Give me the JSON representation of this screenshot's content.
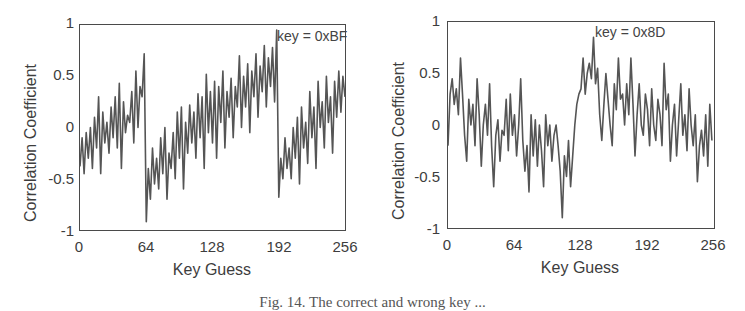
{
  "chart_data": [
    {
      "type": "line",
      "title": "",
      "xlabel": "Key Guess",
      "ylabel": "Correlation Coefficient",
      "xlim": [
        0,
        256
      ],
      "ylim": [
        -1,
        1
      ],
      "xticks": [
        "0",
        "64",
        "128",
        "192",
        "256"
      ],
      "yticks": [
        "1",
        "0.5",
        "0",
        "-0.5",
        "-1"
      ],
      "grid": false,
      "annotation": "key = 0xBF",
      "annotation_x": 191,
      "color": "#555555",
      "x_step": 2,
      "series": [
        {
          "name": "correlation",
          "values": [
            -0.38,
            -0.1,
            -0.45,
            -0.05,
            -0.3,
            0.0,
            -0.4,
            0.1,
            -0.2,
            0.3,
            -0.45,
            0.15,
            -0.15,
            0.05,
            -0.25,
            0.2,
            -0.1,
            0.3,
            -0.2,
            0.43,
            -0.4,
            0.25,
            -0.05,
            0.12,
            0.05,
            0.35,
            -0.15,
            0.55,
            0.0,
            0.4,
            0.3,
            0.72,
            -0.92,
            -0.4,
            -0.7,
            -0.2,
            -0.55,
            -0.3,
            -0.6,
            -0.1,
            -0.45,
            0.0,
            -0.7,
            -0.25,
            -0.4,
            -0.05,
            -0.5,
            0.15,
            -0.3,
            0.2,
            -0.6,
            0.05,
            -0.25,
            0.22,
            -0.15,
            0.15,
            -0.3,
            0.33,
            -0.1,
            0.3,
            -0.4,
            0.52,
            -0.05,
            0.35,
            -0.15,
            0.45,
            -0.3,
            0.4,
            0.05,
            0.55,
            -0.2,
            0.35,
            0.1,
            0.48,
            -0.1,
            0.4,
            0.2,
            0.7,
            0.0,
            0.5,
            0.2,
            0.62,
            -0.05,
            0.55,
            0.3,
            0.72,
            0.1,
            0.6,
            0.35,
            0.8,
            0.2,
            0.68,
            0.4,
            0.78,
            0.25,
            0.95,
            -0.68,
            -0.3,
            -0.5,
            -0.1,
            -0.4,
            -0.2,
            -0.5,
            0.0,
            -0.3,
            0.1,
            -0.55,
            0.2,
            -0.2,
            0.05,
            -0.35,
            0.35,
            -0.1,
            0.2,
            -0.4,
            0.45,
            0.0,
            0.25,
            -0.2,
            0.5,
            0.05,
            0.3,
            -0.25,
            0.45,
            0.1,
            0.55,
            0.15,
            0.5,
            0.3
          ]
        }
      ]
    },
    {
      "type": "line",
      "title": "",
      "xlabel": "Key Guess",
      "ylabel": "Correlation Coefficient",
      "xlim": [
        0,
        256
      ],
      "ylim": [
        -1,
        1
      ],
      "xticks": [
        "0",
        "64",
        "128",
        "192",
        "256"
      ],
      "yticks": [
        "1",
        "0.5",
        "0",
        "-0.5",
        "-1"
      ],
      "grid": false,
      "annotation": "key = 0x8D",
      "annotation_x": 141,
      "color": "#555555",
      "x_step": 2,
      "series": [
        {
          "name": "correlation",
          "values": [
            -0.2,
            0.3,
            0.45,
            0.2,
            0.35,
            0.1,
            0.65,
            0.3,
            -0.1,
            -0.35,
            0.25,
            0.0,
            0.2,
            -0.2,
            0.45,
            0.1,
            -0.4,
            0.0,
            0.2,
            -0.1,
            0.4,
            -0.2,
            -0.6,
            -0.1,
            0.05,
            -0.35,
            -0.05,
            -0.1,
            0.25,
            -0.25,
            0.3,
            -0.1,
            0.1,
            -0.3,
            0.0,
            0.45,
            -0.15,
            -0.45,
            -0.2,
            -0.65,
            0.1,
            -0.3,
            0.05,
            -0.4,
            0.0,
            -0.25,
            -0.6,
            0.1,
            -0.2,
            0.0,
            -0.35,
            -0.1,
            0.0,
            -0.2,
            -0.45,
            -0.9,
            -0.3,
            -0.5,
            -0.15,
            -0.6,
            -0.3,
            0.0,
            0.2,
            0.3,
            0.35,
            0.65,
            0.3,
            0.5,
            0.6,
            0.45,
            0.85,
            0.4,
            0.55,
            0.1,
            -0.15,
            0.2,
            0.5,
            0.25,
            0.0,
            -0.2,
            0.4,
            0.15,
            0.65,
            0.25,
            0.3,
            0.0,
            0.4,
            0.1,
            0.65,
            0.2,
            -0.3,
            0.1,
            0.4,
            0.0,
            -0.1,
            0.3,
            0.15,
            -0.2,
            0.35,
            0.0,
            -0.15,
            0.25,
            0.1,
            -0.2,
            0.6,
            0.15,
            0.3,
            -0.35,
            0.0,
            0.2,
            -0.3,
            0.05,
            0.4,
            -0.1,
            0.1,
            -0.25,
            0.35,
            0.0,
            -0.2,
            0.1,
            -0.55,
            -0.2,
            -0.05,
            -0.3,
            0.1,
            -0.4,
            0.2,
            -0.15
          ]
        }
      ]
    }
  ],
  "plots": {
    "left": {
      "ylabel": "Correlation Coefficient",
      "xlabel": "Key Guess",
      "annotation": "key = 0xBF",
      "yticks": [
        "1",
        "0.5",
        "0",
        "-0.5",
        "-1"
      ],
      "xticks": [
        "0",
        "64",
        "128",
        "192",
        "256"
      ]
    },
    "right": {
      "ylabel": "Correlation Coefficient",
      "xlabel": "Key Guess",
      "annotation": "key = 0x8D",
      "yticks": [
        "1",
        "0.5",
        "0",
        "-0.5",
        "-1"
      ],
      "xticks": [
        "0",
        "64",
        "128",
        "192",
        "256"
      ]
    }
  },
  "caption": "Fig. 14.  The correct and wrong key ..."
}
